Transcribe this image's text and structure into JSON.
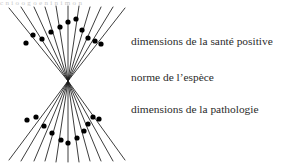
{
  "figure": {
    "title_artifact": "c n i o o    g o  e  n  i  n   i       m   o         n",
    "labels": [
      {
        "text": "dimensions de la santé positive",
        "region": "upper-fan"
      },
      {
        "text": "norme de l’espèce",
        "region": "waist"
      },
      {
        "text": "dimensions de la pathologie",
        "region": "lower-fan"
      }
    ],
    "colors": {
      "background": "#ffffff",
      "line": "#1a1a1a",
      "dot": "#000000",
      "text": "#2b2b2b"
    }
  },
  "chart_data": {
    "type": "scatter",
    "title": "",
    "xlabel": "",
    "ylabel": "",
    "center": {
      "x": 68,
      "y": 81
    },
    "xlim": [
      0,
      131
    ],
    "ylim": [
      0,
      168
    ],
    "grid": false,
    "legend": null,
    "series": [
      {
        "name": "upper-fan",
        "label": "dimensions de la santé positive",
        "ray_count": 11,
        "rays": [
          {
            "x2": 9,
            "y2": 8,
            "dot": {
              "x": 26,
              "y": 43
            }
          },
          {
            "x2": 21,
            "y2": 7,
            "dot": {
              "x": 33,
              "y": 35
            }
          },
          {
            "x2": 34,
            "y2": 7,
            "dot": {
              "x": 42,
              "y": 39
            }
          },
          {
            "x2": 45,
            "y2": 7,
            "dot": {
              "x": 51,
              "y": 32
            }
          },
          {
            "x2": 56,
            "y2": 6,
            "dot": {
              "x": 60,
              "y": 27
            }
          },
          {
            "x2": 68,
            "y2": 6,
            "dot": {
              "x": 68,
              "y": 22
            }
          },
          {
            "x2": 79,
            "y2": 6,
            "dot": {
              "x": 76,
              "y": 19
            }
          },
          {
            "x2": 90,
            "y2": 7,
            "dot": {
              "x": 82,
              "y": 30
            }
          },
          {
            "x2": 101,
            "y2": 7,
            "dot": {
              "x": 88,
              "y": 38
            }
          },
          {
            "x2": 113,
            "y2": 7,
            "dot": {
              "x": 95,
              "y": 41
            }
          },
          {
            "x2": 125,
            "y2": 8,
            "dot": {
              "x": 101,
              "y": 44
            }
          }
        ]
      },
      {
        "name": "lower-fan",
        "label": "dimensions de la pathologie",
        "ray_count": 11,
        "rays": [
          {
            "x2": 9,
            "y2": 160,
            "dot": {
              "x": 27,
              "y": 120
            }
          },
          {
            "x2": 21,
            "y2": 161,
            "dot": {
              "x": 36,
              "y": 117
            }
          },
          {
            "x2": 34,
            "y2": 161,
            "dot": {
              "x": 44,
              "y": 126
            }
          },
          {
            "x2": 45,
            "y2": 161,
            "dot": {
              "x": 52,
              "y": 133
            }
          },
          {
            "x2": 56,
            "y2": 162,
            "dot": {
              "x": 61,
              "y": 140
            }
          },
          {
            "x2": 68,
            "y2": 162,
            "dot": {
              "x": 68,
              "y": 143
            }
          },
          {
            "x2": 79,
            "y2": 162,
            "dot": {
              "x": 77,
              "y": 138
            }
          },
          {
            "x2": 90,
            "y2": 161,
            "dot": {
              "x": 84,
              "y": 131
            }
          },
          {
            "x2": 101,
            "y2": 161,
            "dot": {
              "x": 88,
              "y": 124
            }
          },
          {
            "x2": 113,
            "y2": 161,
            "dot": {
              "x": 93,
              "y": 117
            }
          },
          {
            "x2": 125,
            "y2": 160,
            "dot": {
              "x": 99,
              "y": 119
            }
          }
        ]
      }
    ]
  }
}
